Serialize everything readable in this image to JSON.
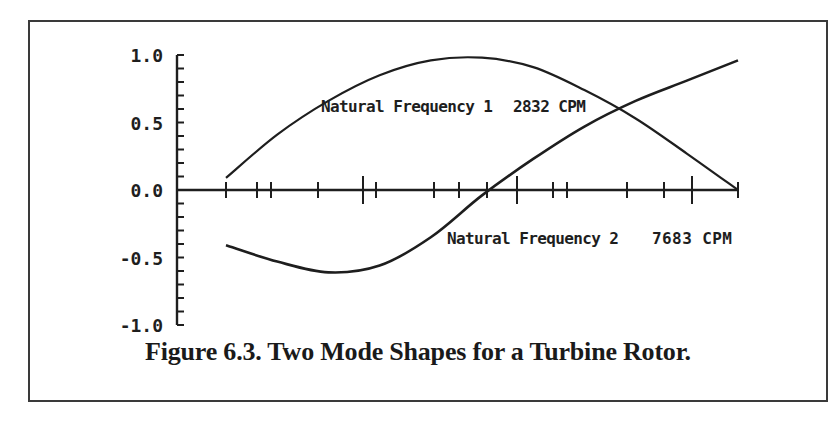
{
  "chart_data": {
    "type": "line",
    "title": "Figure 6.3. Two Mode Shapes for a Turbine Rotor.",
    "xlabel": "",
    "ylabel": "",
    "ylim": [
      -1.0,
      1.0
    ],
    "yticks": [
      "1.0",
      "0.5",
      "0.0",
      "-0.5",
      "-1.0"
    ],
    "grid": false,
    "x": [
      0.0,
      0.1,
      0.2,
      0.3,
      0.4,
      0.5,
      0.6,
      0.7,
      0.8,
      0.9,
      1.0
    ],
    "series": [
      {
        "name": "Natural Frequency 1",
        "annotation": "Natural Frequency 1   2832 CPM",
        "values": [
          0.09,
          0.41,
          0.66,
          0.85,
          0.96,
          0.98,
          0.91,
          0.74,
          0.53,
          0.27,
          0.0
        ]
      },
      {
        "name": "Natural Frequency 2",
        "annotation": "Natural Frequency 2   7683 CPM",
        "values": [
          -0.41,
          -0.53,
          -0.61,
          -0.56,
          -0.35,
          -0.04,
          0.23,
          0.47,
          0.66,
          0.81,
          0.96
        ]
      }
    ]
  },
  "labels": {
    "mode1_name": "Natural Frequency 1",
    "mode1_freq": "2832 CPM",
    "mode2_name": "Natural Frequency 2",
    "mode2_freq": "7683 CPM",
    "caption": "Figure 6.3. Two Mode Shapes for a Turbine Rotor."
  },
  "colors": {
    "ink": "#1e1e1e",
    "background": "#ffffff",
    "border": "#3a3a3a"
  }
}
